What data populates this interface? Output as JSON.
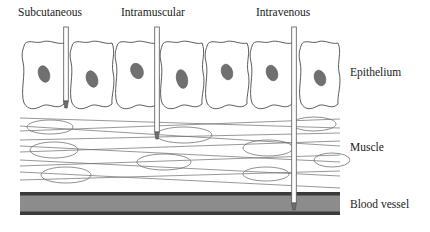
{
  "figure": {
    "background_color": "#ffffff"
  },
  "route_labels": [
    {
      "name": "subcutaneous",
      "text": "Subcutaneous",
      "x": 18,
      "y": 16
    },
    {
      "name": "intramuscular",
      "text": "Intramuscular",
      "x": 121,
      "y": 16
    },
    {
      "name": "intravenous",
      "text": "Intravenous",
      "x": 256,
      "y": 16
    }
  ],
  "layer_labels": [
    {
      "name": "epithelium",
      "text": "Epithelium",
      "x": 350,
      "y": 76
    },
    {
      "name": "muscle",
      "text": "Muscle",
      "x": 350,
      "y": 151
    },
    {
      "name": "blood-vessel",
      "text": "Blood vessel",
      "x": 350,
      "y": 208
    }
  ],
  "needles": [
    {
      "name": "subcutaneous-needle",
      "x": 66,
      "top": 27,
      "tip": 108,
      "width": 4.6,
      "depth_layer": "below epithelium"
    },
    {
      "name": "intramuscular-needle",
      "x": 157,
      "top": 27,
      "tip": 139,
      "width": 4.6,
      "depth_layer": "muscle"
    },
    {
      "name": "intravenous-needle",
      "x": 294,
      "top": 27,
      "tip": 210,
      "width": 4.6,
      "depth_layer": "blood vessel"
    }
  ],
  "epithelium": {
    "colors": {
      "cell_fill": "#ffffff",
      "cell_stroke": "#4a4a4a",
      "nucleus_fill": "#707070"
    },
    "top": 40,
    "bottom": 108,
    "cells": [
      {
        "x": 22,
        "w": 44,
        "nucleus_cx": 44,
        "nucleus_cy": 74,
        "nucleus_rx": 5.5,
        "nucleus_ry": 8.5,
        "nucleus_rot": -18
      },
      {
        "x": 70,
        "w": 44,
        "nucleus_cx": 92,
        "nucleus_cy": 79,
        "nucleus_rx": 5.5,
        "nucleus_ry": 8.5,
        "nucleus_rot": -20
      },
      {
        "x": 115,
        "w": 44,
        "nucleus_cx": 137,
        "nucleus_cy": 71,
        "nucleus_rx": 6.0,
        "nucleus_ry": 8.0,
        "nucleus_rot": -25
      },
      {
        "x": 160,
        "w": 44,
        "nucleus_cx": 182,
        "nucleus_cy": 79,
        "nucleus_rx": 5.5,
        "nucleus_ry": 9.5,
        "nucleus_rot": -12
      },
      {
        "x": 205,
        "w": 44,
        "nucleus_cx": 227,
        "nucleus_cy": 72,
        "nucleus_rx": 5.5,
        "nucleus_ry": 8.0,
        "nucleus_rot": -18
      },
      {
        "x": 250,
        "w": 44,
        "nucleus_cx": 272,
        "nucleus_cy": 73,
        "nucleus_rx": 5.5,
        "nucleus_ry": 8.0,
        "nucleus_rot": -20
      },
      {
        "x": 299,
        "w": 41,
        "nucleus_cx": 320,
        "nucleus_cy": 78,
        "nucleus_rx": 5.5,
        "nucleus_ry": 8.0,
        "nucleus_rot": -20
      }
    ]
  },
  "muscle": {
    "colors": {
      "fiber_stroke": "#6b6b6b",
      "cell_stroke": "#6b6b6b"
    },
    "top": 112,
    "bottom": 190,
    "fibers": [
      {
        "x1": 20,
        "y1": 118,
        "x2": 340,
        "y2": 128
      },
      {
        "x1": 20,
        "y1": 131,
        "x2": 340,
        "y2": 119
      },
      {
        "x1": 20,
        "y1": 140,
        "x2": 340,
        "y2": 133
      },
      {
        "x1": 20,
        "y1": 126,
        "x2": 340,
        "y2": 146
      },
      {
        "x1": 20,
        "y1": 152,
        "x2": 340,
        "y2": 141
      },
      {
        "x1": 20,
        "y1": 146,
        "x2": 340,
        "y2": 162
      },
      {
        "x1": 20,
        "y1": 166,
        "x2": 340,
        "y2": 155
      },
      {
        "x1": 20,
        "y1": 160,
        "x2": 340,
        "y2": 176
      },
      {
        "x1": 20,
        "y1": 180,
        "x2": 340,
        "y2": 171
      },
      {
        "x1": 20,
        "y1": 172,
        "x2": 340,
        "y2": 188
      }
    ],
    "cells": [
      {
        "cx": 50,
        "cy": 127,
        "rx": 23,
        "ry": 7
      },
      {
        "cx": 184,
        "cy": 135,
        "rx": 28,
        "ry": 8
      },
      {
        "cx": 314,
        "cy": 124,
        "rx": 22,
        "ry": 7
      },
      {
        "cx": 54,
        "cy": 150,
        "rx": 24,
        "ry": 8
      },
      {
        "cx": 268,
        "cy": 148,
        "rx": 25,
        "ry": 8
      },
      {
        "cx": 164,
        "cy": 162,
        "rx": 27,
        "ry": 8
      },
      {
        "cx": 66,
        "cy": 175,
        "rx": 25,
        "ry": 8
      },
      {
        "cx": 266,
        "cy": 174,
        "rx": 23,
        "ry": 7
      },
      {
        "cx": 332,
        "cy": 160,
        "rx": 18,
        "ry": 7
      }
    ]
  },
  "blood_vessel": {
    "colors": {
      "fill": "#8c8c8c",
      "edge": "#3a3a3a"
    },
    "x": 20,
    "width": 320,
    "top": 192,
    "height": 23,
    "edge_thickness": 3.5
  }
}
